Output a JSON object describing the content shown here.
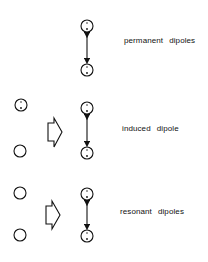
{
  "diagram": {
    "rows": [
      {
        "id": "permanent",
        "label_words": [
          "permanent",
          "dipoles"
        ],
        "has_source_molecules": false,
        "source_molecules": [],
        "dipole_pair": [
          "dipole (-/+)",
          "dipole (-/+)"
        ],
        "interaction": "double-headed arrow"
      },
      {
        "id": "induced",
        "label_words": [
          "induced",
          "dipole"
        ],
        "has_source_molecules": true,
        "source_molecules": [
          "dipole (-/+)",
          "nonpolar"
        ],
        "transform": "block arrow",
        "dipole_pair": [
          "dipole (-/+)",
          "dipole (-/+)"
        ],
        "interaction": "double-headed arrow"
      },
      {
        "id": "resonant",
        "label_words": [
          "resonant",
          "dipoles"
        ],
        "has_source_molecules": true,
        "source_molecules": [
          "nonpolar",
          "nonpolar"
        ],
        "transform": "block arrow",
        "dipole_pair": [
          "dipole (-/+)",
          "dipole (-/+)"
        ],
        "interaction": "double-headed arrow"
      }
    ],
    "colors": {
      "stroke": "#111111",
      "background": "#ffffff"
    }
  }
}
